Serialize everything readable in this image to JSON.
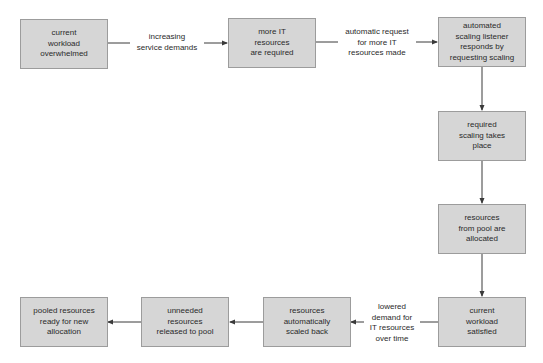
{
  "diagram": {
    "type": "flowchart",
    "title": "",
    "nodes": [
      {
        "id": "n1",
        "text": "current\nworkload\noverwhelmed"
      },
      {
        "id": "n2",
        "text": "more IT\nresources\nare required"
      },
      {
        "id": "n3",
        "text": "automated\nscaling listener\nresponds by\nrequesting scaling"
      },
      {
        "id": "n4",
        "text": "required\nscaling takes\nplace"
      },
      {
        "id": "n5",
        "text": "resources\nfrom pool are\nallocated"
      },
      {
        "id": "n6",
        "text": "current\nworkload\nsatisfied"
      },
      {
        "id": "n7",
        "text": "resources\nautomatically\nscaled back"
      },
      {
        "id": "n8",
        "text": "unneeded\nresources\nreleased to pool"
      },
      {
        "id": "n9",
        "text": "pooled resources\nready for new\nallocation"
      }
    ],
    "edges": [
      {
        "from": "n1",
        "to": "n2",
        "label": "increasing\nservice demands"
      },
      {
        "from": "n2",
        "to": "n3",
        "label": "automatic request\nfor more IT\nresources made"
      },
      {
        "from": "n3",
        "to": "n4",
        "label": ""
      },
      {
        "from": "n4",
        "to": "n5",
        "label": ""
      },
      {
        "from": "n5",
        "to": "n6",
        "label": ""
      },
      {
        "from": "n6",
        "to": "n7",
        "label": "lowered\ndemand for\nIT resources\nover time"
      },
      {
        "from": "n7",
        "to": "n8",
        "label": ""
      },
      {
        "from": "n8",
        "to": "n9",
        "label": ""
      }
    ]
  },
  "colors": {
    "box_fill": "#d6d6d6",
    "box_border": "#9c9c9c",
    "arrow": "#3a3a3a",
    "text": "#2a2a2a",
    "background": "#ffffff"
  }
}
